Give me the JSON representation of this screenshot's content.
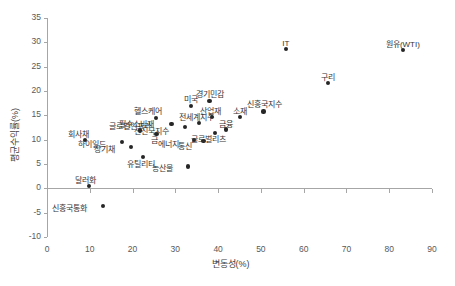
{
  "chart_data": {
    "type": "scatter",
    "title": "",
    "xlabel": "변동성(%)",
    "ylabel": "평균수익률(%)",
    "xlim": [
      0,
      90
    ],
    "ylim": [
      -10,
      35
    ],
    "xticks": [
      0,
      10,
      20,
      30,
      40,
      50,
      60,
      70,
      80,
      90
    ],
    "yticks": [
      -10,
      -5,
      0,
      5,
      10,
      15,
      20,
      25,
      30,
      35
    ],
    "grid": false,
    "legend": "none",
    "marker_color": "#262626",
    "axis_color": "#a6a6a6",
    "points": [
      {
        "label": "회사채",
        "x": 8.8,
        "y": 9.9,
        "lx": -6,
        "ly": -10,
        "anchor": "center"
      },
      {
        "label": "달러화",
        "x": 9.8,
        "y": 0.5,
        "lx": -3,
        "ly": -10,
        "anchor": "center"
      },
      {
        "label": "신흥국통화",
        "x": 13.0,
        "y": -3.7,
        "lx": -16,
        "ly": -2,
        "anchor": "right"
      },
      {
        "label": "하이일드",
        "x": 17.5,
        "y": 9.6,
        "lx": -16,
        "ly": -2,
        "anchor": "right"
      },
      {
        "label": "장기채",
        "x": 19.6,
        "y": 8.5,
        "lx": -16,
        "ly": -2,
        "anchor": "right"
      },
      {
        "label": "필수소비재",
        "x": 21.8,
        "y": 11.9,
        "lx": -4,
        "ly": -10,
        "anchor": "center"
      },
      {
        "label": "유틸리티",
        "x": 22.4,
        "y": 6.5,
        "lx": -2,
        "ly": 3,
        "anchor": "center"
      },
      {
        "label": "헬스케어",
        "x": 25.4,
        "y": 14.5,
        "lx": -8,
        "ly": -11,
        "anchor": "center"
      },
      {
        "label": "금",
        "x": 25.6,
        "y": 11.2,
        "lx": -2,
        "ly": 2,
        "anchor": "center"
      },
      {
        "label": "글로벌인프라",
        "x": 29.1,
        "y": 13.3,
        "lx": -20,
        "ly": -2,
        "anchor": "right"
      },
      {
        "label": "선진국지수",
        "x": 32.2,
        "y": 12.6,
        "lx": -16,
        "ly": 0,
        "anchor": "right"
      },
      {
        "label": "농산물",
        "x": 33.0,
        "y": 4.5,
        "lx": -15,
        "ly": -2,
        "anchor": "right"
      },
      {
        "label": "미국",
        "x": 33.6,
        "y": 17.0,
        "lx": 0,
        "ly": -11,
        "anchor": "center"
      },
      {
        "label": "에너지",
        "x": 34.4,
        "y": 10.0,
        "lx": -15,
        "ly": 0,
        "anchor": "right"
      },
      {
        "label": "전세계지수",
        "x": 35.6,
        "y": 13.4,
        "lx": -3,
        "ly": -10,
        "anchor": "center"
      },
      {
        "label": "통신",
        "x": 36.6,
        "y": 9.8,
        "lx": -12,
        "ly": 1,
        "anchor": "right"
      },
      {
        "label": "경기민감",
        "x": 38.0,
        "y": 18.0,
        "lx": 0,
        "ly": -11,
        "anchor": "center"
      },
      {
        "label": "산업재",
        "x": 38.6,
        "y": 14.6,
        "lx": -2,
        "ly": -10,
        "anchor": "center"
      },
      {
        "label": "글로벌리츠",
        "x": 39.2,
        "y": 11.4,
        "lx": -6,
        "ly": 2,
        "anchor": "center"
      },
      {
        "label": "금융",
        "x": 41.8,
        "y": 12.1,
        "lx": 0,
        "ly": -9,
        "anchor": "center"
      },
      {
        "label": "소재",
        "x": 45.2,
        "y": 14.6,
        "lx": 0,
        "ly": -10,
        "anchor": "center"
      },
      {
        "label": "신흥국지수",
        "x": 50.6,
        "y": 15.8,
        "lx": 1,
        "ly": -11,
        "anchor": "center"
      },
      {
        "label": "IT",
        "x": 55.8,
        "y": 28.6,
        "lx": 0,
        "ly": -10,
        "anchor": "center"
      },
      {
        "label": "구리",
        "x": 65.7,
        "y": 21.7,
        "lx": 0,
        "ly": -10,
        "anchor": "center"
      },
      {
        "label": "원유(WTI)",
        "x": 83.2,
        "y": 28.5,
        "lx": 0,
        "ly": -10,
        "anchor": "center"
      }
    ]
  }
}
